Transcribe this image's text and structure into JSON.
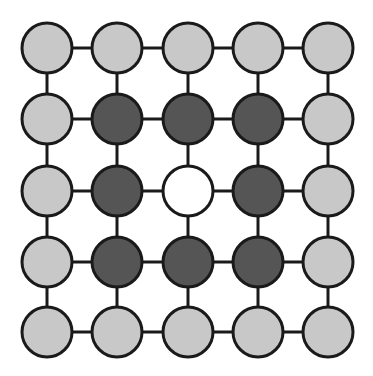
{
  "diagram": {
    "type": "grid-graph",
    "rows": 5,
    "cols": 5,
    "col_x": [
      47,
      117,
      188,
      258,
      328
    ],
    "row_y": [
      48,
      119,
      191,
      262,
      332
    ],
    "node_radius": 25,
    "stroke_width": 3,
    "edge_width": 3,
    "colors": {
      "light": "#c8c8c8",
      "dark": "#555555",
      "white": "#ffffff",
      "stroke": "#1a1a1a",
      "background": "#ffffff"
    },
    "grid": [
      [
        "light",
        "light",
        "light",
        "light",
        "light"
      ],
      [
        "light",
        "dark",
        "dark",
        "dark",
        "light"
      ],
      [
        "light",
        "dark",
        "white",
        "dark",
        "light"
      ],
      [
        "light",
        "dark",
        "dark",
        "dark",
        "light"
      ],
      [
        "light",
        "light",
        "light",
        "light",
        "light"
      ]
    ]
  }
}
